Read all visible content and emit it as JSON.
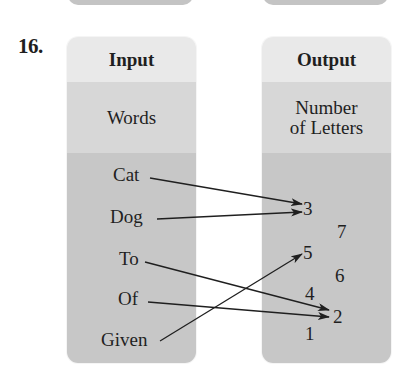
{
  "problem": {
    "number": "16."
  },
  "input_box": {
    "title": "Input",
    "label": "Words",
    "items": [
      "Cat",
      "Dog",
      "To",
      "Of",
      "Given"
    ]
  },
  "output_box": {
    "title": "Output",
    "label_line1": "Number",
    "label_line2": "of Letters",
    "items": [
      "3",
      "7",
      "5",
      "6",
      "4",
      "2",
      "1"
    ]
  },
  "mapping": [
    {
      "from": "Cat",
      "to": "3"
    },
    {
      "from": "Dog",
      "to": "3"
    },
    {
      "from": "To",
      "to": "2"
    },
    {
      "from": "Of",
      "to": "2"
    },
    {
      "from": "Given",
      "to": "5"
    }
  ],
  "colors": {
    "header_band": "#e9e9e9",
    "label_band": "#d7d7d7",
    "body_band": "#c7c7c7",
    "ink": "#1f1f1f"
  }
}
